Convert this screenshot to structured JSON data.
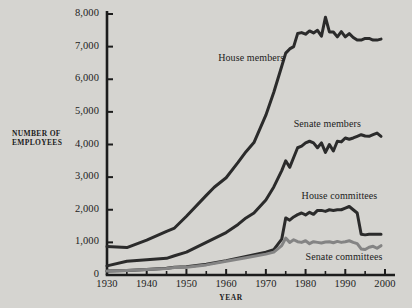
{
  "chart_data": {
    "type": "line",
    "title": "",
    "xlabel": "YEAR",
    "ylabel": "NUMBER OF EMPLOYEES",
    "ylabel_line1": "NUMBER OF",
    "ylabel_line2": "EMPLOYEES",
    "xlim": [
      1930,
      2000
    ],
    "ylim": [
      0,
      8000
    ],
    "grid": false,
    "legend_position": "inline-annotations",
    "xticks": [
      1930,
      1940,
      1950,
      1960,
      1970,
      1980,
      1990,
      2000
    ],
    "xtick_labels": [
      "1930",
      "1940",
      "1950",
      "1960",
      "1970",
      "1980",
      "1990",
      "2000"
    ],
    "xminor_ticks": [
      1935,
      1945,
      1955,
      1965,
      1975,
      1985,
      1995
    ],
    "yticks": [
      0,
      1000,
      2000,
      3000,
      4000,
      5000,
      6000,
      7000,
      8000
    ],
    "ytick_labels": [
      "0",
      "1,000",
      "2,000",
      "3,000",
      "4,000",
      "5,000",
      "6,000",
      "7,000",
      "8,000"
    ],
    "series": [
      {
        "name": "House members",
        "color": "#2b2b2b",
        "label_x": 1958,
        "label_y": 6650,
        "x": [
          1930,
          1935,
          1940,
          1945,
          1947,
          1950,
          1955,
          1957,
          1960,
          1963,
          1965,
          1967,
          1970,
          1972,
          1974,
          1975,
          1976,
          1977,
          1978,
          1979,
          1980,
          1981,
          1982,
          1983,
          1984,
          1985,
          1986,
          1987,
          1988,
          1989,
          1990,
          1991,
          1992,
          1993,
          1994,
          1995,
          1996,
          1997,
          1998,
          1999
        ],
        "values": [
          870,
          840,
          1070,
          1340,
          1440,
          1800,
          2440,
          2690,
          2980,
          3450,
          3780,
          4060,
          4900,
          5600,
          6400,
          6800,
          6930,
          7000,
          7400,
          7430,
          7380,
          7480,
          7420,
          7500,
          7320,
          7900,
          7450,
          7450,
          7300,
          7460,
          7300,
          7400,
          7280,
          7200,
          7200,
          7250,
          7250,
          7200,
          7200,
          7230
        ]
      },
      {
        "name": "Senate members",
        "color": "#2b2b2b",
        "label_x": 1977,
        "label_y": 4620,
        "x": [
          1930,
          1935,
          1940,
          1945,
          1947,
          1950,
          1955,
          1960,
          1963,
          1965,
          1967,
          1970,
          1972,
          1974,
          1975,
          1976,
          1977,
          1978,
          1979,
          1980,
          1981,
          1982,
          1983,
          1984,
          1985,
          1986,
          1987,
          1988,
          1989,
          1990,
          1991,
          1992,
          1993,
          1994,
          1995,
          1996,
          1997,
          1998,
          1999
        ],
        "values": [
          280,
          420,
          470,
          510,
          590,
          700,
          1000,
          1300,
          1550,
          1750,
          1900,
          2300,
          2700,
          3200,
          3500,
          3300,
          3600,
          3900,
          3950,
          4050,
          4100,
          4050,
          3900,
          4050,
          3760,
          4000,
          3800,
          4100,
          4080,
          4200,
          4160,
          4200,
          4250,
          4300,
          4260,
          4250,
          4300,
          4350,
          4250
        ]
      },
      {
        "name": "House committees",
        "color": "#2b2b2b",
        "label_x": 1979,
        "label_y": 2420,
        "x": [
          1930,
          1935,
          1940,
          1945,
          1947,
          1950,
          1955,
          1960,
          1965,
          1970,
          1972,
          1974,
          1975,
          1976,
          1977,
          1978,
          1979,
          1980,
          1981,
          1982,
          1983,
          1984,
          1985,
          1986,
          1987,
          1988,
          1989,
          1990,
          1991,
          1992,
          1993,
          1994,
          1995,
          1996,
          1997,
          1998,
          1999
        ],
        "values": [
          120,
          140,
          170,
          210,
          240,
          250,
          330,
          440,
          570,
          700,
          780,
          1100,
          1750,
          1680,
          1780,
          1850,
          1900,
          1840,
          1920,
          1860,
          1980,
          1980,
          1950,
          2000,
          1980,
          2000,
          2000,
          2050,
          2100,
          2000,
          1900,
          1250,
          1230,
          1250,
          1250,
          1250,
          1250
        ]
      },
      {
        "name": "Senate committees",
        "color": "#848484",
        "label_x": 1980,
        "label_y": 560,
        "x": [
          1930,
          1935,
          1940,
          1945,
          1947,
          1950,
          1955,
          1960,
          1965,
          1970,
          1972,
          1974,
          1975,
          1976,
          1977,
          1978,
          1979,
          1980,
          1981,
          1982,
          1983,
          1984,
          1985,
          1986,
          1987,
          1988,
          1989,
          1990,
          1991,
          1992,
          1993,
          1994,
          1995,
          1996,
          1997,
          1998,
          1999
        ],
        "values": [
          120,
          140,
          170,
          200,
          230,
          240,
          310,
          420,
          530,
          640,
          700,
          900,
          1130,
          1000,
          1080,
          1020,
          1000,
          1050,
          960,
          1020,
          1000,
          980,
          1010,
          1020,
          990,
          1030,
          1000,
          1020,
          1050,
          1000,
          960,
          800,
          780,
          850,
          880,
          820,
          900
        ]
      }
    ]
  },
  "colors": {
    "background": "#d5d4d0",
    "axis": "#1c1c1c",
    "dark_series": "#2b2b2b",
    "gray_series": "#848484"
  }
}
